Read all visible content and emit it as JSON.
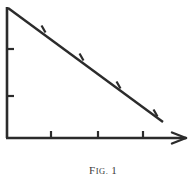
{
  "figure": {
    "caption_prefix": "F",
    "caption_prefix_small": "IG.",
    "caption_number": "1",
    "caption_full": "FIG. 1",
    "ink_color": "#2b2b2b",
    "background_color": "#ffffff"
  },
  "geometry": {
    "origin": {
      "x": 7,
      "y": 138
    },
    "vertical_axis": {
      "x1": 7,
      "y1": 7,
      "x2": 7,
      "y2": 138
    },
    "horizontal_axis": {
      "x1": 7,
      "y1": 138,
      "x2": 186,
      "y2": 138
    },
    "hypotenuse": {
      "x1": 8,
      "y1": 8,
      "x2": 163,
      "y2": 122
    },
    "arrowhead": {
      "tip_x": 186,
      "tip_y": 138,
      "length": 14,
      "spread": 5
    }
  },
  "ticks": {
    "vertical_axis_ticks": [
      {
        "label": "y-tick-1",
        "y": 49,
        "length": 6
      },
      {
        "label": "y-tick-2",
        "y": 96,
        "length": 6
      }
    ],
    "horizontal_axis_ticks": [
      {
        "label": "x-tick-1",
        "x": 51,
        "length": 6
      },
      {
        "label": "x-tick-2",
        "x": 98,
        "length": 6
      },
      {
        "label": "x-tick-3",
        "x": 143,
        "length": 6
      }
    ],
    "hypotenuse_ticks": [
      {
        "label": "h-tick-1",
        "x": 43,
        "y": 29,
        "length": 7
      },
      {
        "label": "h-tick-2",
        "x": 81,
        "y": 57,
        "length": 7
      },
      {
        "label": "h-tick-3",
        "x": 118,
        "y": 85,
        "length": 7
      },
      {
        "label": "h-tick-4",
        "x": 155,
        "y": 113,
        "length": 7
      }
    ]
  }
}
